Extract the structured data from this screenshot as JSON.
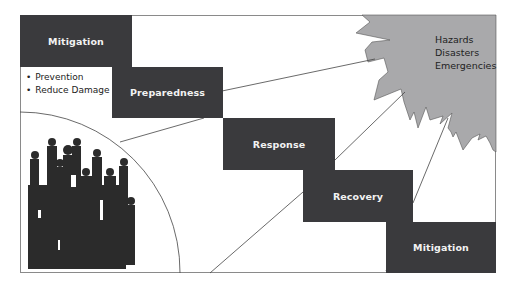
{
  "diagram": {
    "phases": [
      {
        "label": "Mitigation"
      },
      {
        "label": "Preparedness"
      },
      {
        "label": "Response"
      },
      {
        "label": "Recovery"
      },
      {
        "label": "Mitigation"
      }
    ],
    "mitigation_bullets": [
      "Prevention",
      "Reduce Damage"
    ],
    "hazard_labels": [
      "Hazards",
      "Disasters",
      "Emergencies"
    ],
    "colors": {
      "box": "#3a3a3d",
      "box_text": "#f2f2f2",
      "hazard_fill": "#a9a9ab",
      "crowd": "#2b2b2b"
    }
  }
}
